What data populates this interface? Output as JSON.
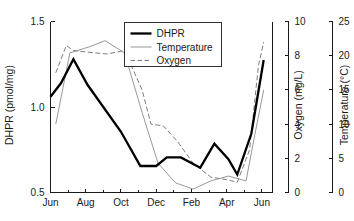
{
  "chart_data": {
    "type": "line",
    "title": "",
    "xlabel": "",
    "grid": false,
    "legend_position": "top-center",
    "x_ticklabels": [
      "Jun",
      "Aug",
      "Oct",
      "Dec",
      "Feb",
      "Apr",
      "Jun"
    ],
    "x_tick_months": [
      0,
      2,
      4,
      6,
      8,
      10,
      12
    ],
    "x_minor_tick_months": [
      1,
      3,
      5,
      7,
      9,
      11
    ],
    "xlim": [
      0,
      12.6
    ],
    "axes": [
      {
        "id": "dhpr",
        "side": "left",
        "label": "DHPR (pmol/mg)",
        "ticks": [
          0.5,
          1.0,
          1.5
        ],
        "ticklabels": [
          "0.5",
          "1.0",
          "1.5"
        ],
        "lim": [
          0.5,
          1.5
        ],
        "color": "#000000"
      },
      {
        "id": "oxygen",
        "side": "right-inner",
        "label": "Oxygen (mg/L)",
        "ticks": [
          0,
          2,
          4,
          6,
          8,
          10
        ],
        "ticklabels": [
          "0",
          "2",
          "4",
          "6",
          "8",
          "10"
        ],
        "lim": [
          0,
          10
        ],
        "color": "#6e6e6e"
      },
      {
        "id": "temperature",
        "side": "right-outer",
        "label": "Temperature (°C)",
        "ticks": [
          0,
          5,
          10,
          15,
          20,
          25
        ],
        "ticklabels": [
          "0",
          "5",
          "10",
          "15",
          "20",
          "25"
        ],
        "lim": [
          0,
          25
        ],
        "color": "#8c8c8c"
      }
    ],
    "series": [
      {
        "name": "DHPR",
        "axis": "dhpr",
        "style": "solid-thick",
        "color": "#000000",
        "x": [
          0.0,
          0.6,
          1.3,
          2.1,
          4.0,
          5.1,
          6.0,
          6.6,
          7.4,
          8.5,
          9.3,
          10.1,
          10.6,
          11.4,
          12.1
        ],
        "values": [
          1.06,
          1.14,
          1.28,
          1.13,
          0.855,
          0.655,
          0.655,
          0.705,
          0.705,
          0.645,
          0.785,
          0.695,
          0.605,
          0.845,
          1.275
        ]
      },
      {
        "name": "Temperature",
        "axis": "temperature",
        "style": "solid-thin",
        "color": "#8c8c8c",
        "x": [
          0.3,
          1.1,
          2.2,
          3.1,
          4.2,
          5.2,
          6.1,
          7.1,
          8.1,
          9.1,
          10.1,
          11.1,
          11.6,
          12.1
        ],
        "values": [
          10.0,
          20.4,
          21.3,
          22.2,
          20.4,
          11.7,
          4.3,
          1.4,
          0.5,
          1.7,
          2.4,
          1.7,
          8.5,
          15.0
        ]
      },
      {
        "name": "Oxygen",
        "axis": "oxygen",
        "style": "dashed",
        "color": "#6e6e6e",
        "x": [
          0.3,
          0.9,
          1.3,
          2.2,
          3.2,
          4.2,
          5.2,
          5.7,
          6.4,
          7.2,
          8.1,
          9.1,
          10.0,
          10.6,
          11.3,
          11.8,
          12.1
        ],
        "values": [
          7.0,
          8.6,
          8.3,
          8.2,
          8.1,
          8.3,
          6.0,
          4.0,
          3.9,
          3.0,
          1.7,
          0.9,
          0.75,
          0.6,
          2.5,
          7.4,
          8.8
        ]
      }
    ],
    "legend": [
      {
        "label": "DHPR",
        "style": "solid-thick",
        "color": "#000000"
      },
      {
        "label": "Temperature",
        "style": "solid-thin",
        "color": "#8c8c8c"
      },
      {
        "label": "Oxygen",
        "style": "dashed",
        "color": "#6e6e6e"
      }
    ]
  }
}
